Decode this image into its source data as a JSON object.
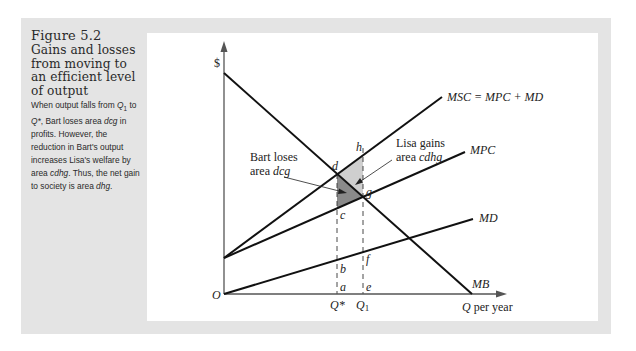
{
  "caption": {
    "figure_number": "Figure 5.2",
    "title": "Gains and losses from moving to an efficient level of output",
    "description_parts": [
      {
        "text": "When output falls from ",
        "italic": false
      },
      {
        "text": "Q",
        "italic": true
      },
      {
        "text": "1",
        "italic": false,
        "sub": true
      },
      {
        "text": " to ",
        "italic": false
      },
      {
        "text": "Q*",
        "italic": true
      },
      {
        "text": ", Bart loses area ",
        "italic": false
      },
      {
        "text": "dcg",
        "italic": true
      },
      {
        "text": " in profits. However, the reduction in Bart's output increases Lisa's welfare by area ",
        "italic": false
      },
      {
        "text": "cdhg",
        "italic": true
      },
      {
        "text": ". Thus, the net gain to society is area ",
        "italic": false
      },
      {
        "text": "dhg",
        "italic": true
      },
      {
        "text": ".",
        "italic": false
      }
    ]
  },
  "chart_data": {
    "type": "line",
    "title": "Gains and losses from moving to an efficient level of output",
    "xlabel": "Q per year",
    "ylabel": "$",
    "origin_label": "O",
    "grid": false,
    "legend": "inline labels at line ends",
    "x_ticks": [
      "Q*",
      "Q1"
    ],
    "series": [
      {
        "name": "MSC = MPC + MD",
        "points": [
          [
            0,
            36
          ],
          [
            218,
            197
          ]
        ],
        "description": "upward sloping, steepest"
      },
      {
        "name": "MPC",
        "points": [
          [
            0,
            36
          ],
          [
            241,
            142
          ]
        ],
        "description": "upward sloping"
      },
      {
        "name": "MD",
        "points": [
          [
            0,
            0
          ],
          [
            249,
            75
          ]
        ],
        "description": "upward sloping from origin"
      },
      {
        "name": "MB",
        "points": [
          [
            0,
            221
          ],
          [
            248,
            0
          ]
        ],
        "description": "downward sloping"
      }
    ],
    "points_labels": {
      "d": "MB ∩ MSC at Q*",
      "g": "MB ∩ MPC at Q1",
      "h": "MSC at Q1",
      "c": "MPC at Q*",
      "b": "MD at Q*",
      "f": "MD at Q1",
      "a": "axis at Q*",
      "e": "axis at Q1"
    },
    "shaded_areas": [
      {
        "name": "dcg",
        "shade": "dark gray",
        "meaning": "Bart loses"
      },
      {
        "name": "dhg",
        "shade": "light gray",
        "meaning": "net gain to society"
      }
    ],
    "annotations": [
      {
        "text": "Bart loses area dcg",
        "points_to": "dcg"
      },
      {
        "text": "Lisa gains area cdhg",
        "points_to": "cdhg"
      }
    ]
  },
  "labels": {
    "dollar": "$",
    "origin": "O",
    "x_axis": "Q per year",
    "msc": "MSC = MPC + MD",
    "mpc": "MPC",
    "md": "MD",
    "mb": "MB",
    "q_star": "Q*",
    "q1_main": "Q",
    "q1_sub": "1",
    "d": "d",
    "h": "h",
    "g": "g",
    "c": "c",
    "b": "b",
    "f": "f",
    "a": "a",
    "e": "e",
    "bart_line1": "Bart loses",
    "bart_line2_prefix": "area ",
    "bart_line2_italic": "dcg",
    "lisa_line1": "Lisa gains",
    "lisa_line2_prefix": "area ",
    "lisa_line2_italic": "cdhg"
  },
  "colors": {
    "frame_gray": "#e4e4e4",
    "dark_shade": "#8a8a8a",
    "light_shade": "#cfcfcf",
    "line": "#111111",
    "axis": "#555555"
  }
}
